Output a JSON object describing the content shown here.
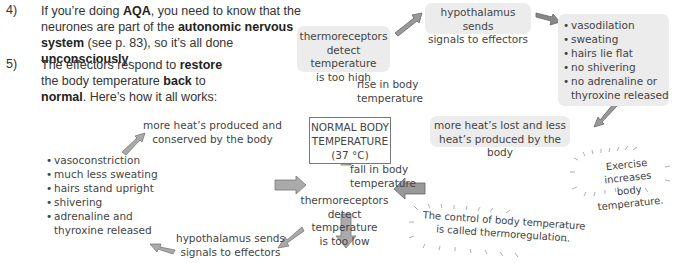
{
  "steps": [
    {
      "number": "4)",
      "segments": [
        {
          "text": "If you’re doing ",
          "bold": false
        },
        {
          "text": "AQA",
          "bold": true
        },
        {
          "text": ", you need to know that the neurones are part of the ",
          "bold": false
        },
        {
          "text": "autonomic nervous system",
          "bold": true
        },
        {
          "text": " (see p. 83), so it’s all done ",
          "bold": false
        },
        {
          "text": "unconsciously",
          "bold": true
        },
        {
          "text": ".",
          "bold": false
        }
      ]
    },
    {
      "number": "5)",
      "segments": [
        {
          "text": "The effectors respond to ",
          "bold": false
        },
        {
          "text": "restore",
          "bold": true
        },
        {
          "text": " the body temperature ",
          "bold": false
        },
        {
          "text": "back",
          "bold": true
        },
        {
          "text": " to ",
          "bold": false
        },
        {
          "text": "normal",
          "bold": true
        },
        {
          "text": ". Here’s how it all works:",
          "bold": false
        }
      ]
    }
  ],
  "diagram": {
    "center": {
      "line1": "NORMAL BODY",
      "line2": "TEMPERATURE",
      "line3": "(37 °C)"
    },
    "hot_path": {
      "rise_label": {
        "line1": "rise in body",
        "line2": "temperature"
      },
      "detect": {
        "line1": "thermoreceptors",
        "line2": "detect temperature",
        "line3": "is too high"
      },
      "hypothalamus": {
        "line1": "hypothalamus sends",
        "line2": "signals to effectors"
      },
      "responses": [
        "vasodilation",
        "sweating",
        "hairs lie flat",
        "no shivering",
        "no adrenaline or",
        "thyroxine released"
      ],
      "result": {
        "line1": "more heat’s lost and less",
        "line2": "heat’s produced by the body"
      }
    },
    "cold_path": {
      "fall_label": {
        "line1": "fall in body",
        "line2": "temperature"
      },
      "detect": {
        "line1": "thermoreceptors",
        "line2": "detect temperature",
        "line3": "is too low"
      },
      "hypothalamus": {
        "line1": "hypothalamus sends",
        "line2": "signals to effectors"
      },
      "responses": [
        "vasoconstriction",
        "much less sweating",
        "hairs stand upright",
        "shivering",
        "adrenaline and",
        "thyroxine released"
      ],
      "result": {
        "line1": "more heat’s produced and",
        "line2": "conserved by the body"
      }
    }
  },
  "notes": [
    {
      "line1": "Exercise increases",
      "line2": "body temperature."
    },
    {
      "line1": "The control of body temperature",
      "line2": "is called thermoregulation."
    }
  ]
}
